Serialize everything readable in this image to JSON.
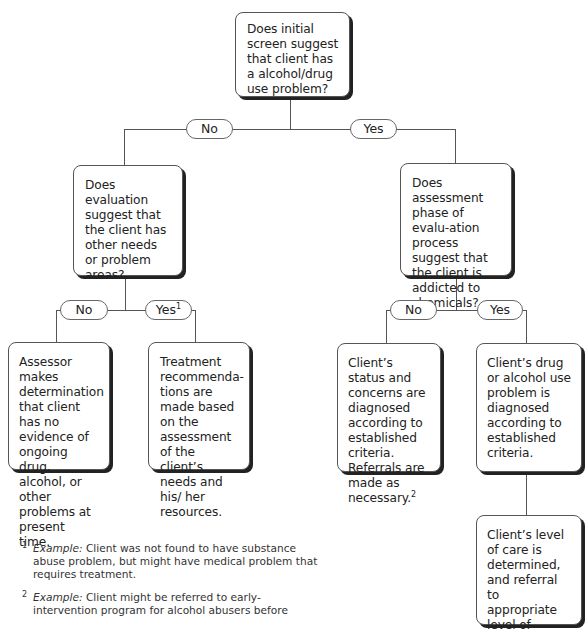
{
  "flowchart": {
    "root": {
      "text": "Does initial screen suggest that client has a alcohol/drug use problem?"
    },
    "root_branches": {
      "no_label": "No",
      "yes_label": "Yes"
    },
    "left_question": {
      "text": "Does evaluation suggest that the client has other needs or problem areas?"
    },
    "right_question": {
      "text": "Does assessment phase of evalu-ation process suggest that the client is addicted to chemicals?"
    },
    "left_branches": {
      "no_label": "No",
      "yes_label": "Yes",
      "yes_footnote_mark": "1"
    },
    "right_branches": {
      "no_label": "No",
      "yes_label": "Yes"
    },
    "outcomes": {
      "no_problem": "Assessor makes determination that client has no evidence of ongoing drug, alcohol, or other problems at present time.",
      "treatment_recommendations": "Treatment recommenda-tions are made based on the assessment of the client’s needs and his/ her resources.",
      "status_diagnosed": "Client’s status and concerns are diagnosed according to established criteria. Referrals are made as necessary.",
      "status_diagnosed_footnote_mark": "2",
      "use_problem_diagnosed": "Client’s drug or alcohol use problem is diagnosed according to established criteria.",
      "level_of_care": "Client’s level of care is determined, and referral to appropriate level of"
    },
    "connector_color": "#555555",
    "shadow_color": "#222222"
  },
  "footnotes": [
    {
      "mark": "1",
      "label": "Example:",
      "text": " Client was not found to have substance abuse problem, but might have medical problem that requires treatment."
    },
    {
      "mark": "2",
      "label": "Example:",
      "text": " Client might be referred to early-intervention program for alcohol abusers before"
    }
  ]
}
